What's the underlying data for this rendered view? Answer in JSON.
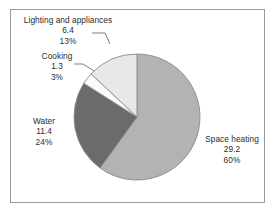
{
  "chart_data": {
    "type": "pie",
    "title": "",
    "subtitle": "",
    "xlabel": "",
    "ylabel": "",
    "legend_position": "none",
    "grid": false,
    "total": 48.3,
    "categories": [
      "Space heating",
      "Water",
      "Cooking",
      "Lighting and appliances"
    ],
    "values": [
      29.2,
      11.4,
      1.3,
      6.4
    ],
    "percentages": [
      "60%",
      "24%",
      "3%",
      "13%"
    ],
    "slices": [
      {
        "name": "Space heating",
        "value": "29.2",
        "percent": "60%",
        "percent_number": 60,
        "color": "#b3b3b3",
        "label_position": "right"
      },
      {
        "name": "Water",
        "value": "11.4",
        "percent": "24%",
        "percent_number": 24,
        "color": "#6b6b6b",
        "label_position": "left"
      },
      {
        "name": "Cooking",
        "value": "1.3",
        "percent": "3%",
        "percent_number": 3,
        "color": "#fbfbfb",
        "label_position": "upper-left"
      },
      {
        "name": "Lighting and appliances",
        "value": "6.4",
        "percent": "13%",
        "percent_number": 13,
        "color": "#e8e8e8",
        "label_position": "top-left"
      }
    ]
  },
  "colors": {
    "space_heating": "#b3b3b3",
    "water": "#6b6b6b",
    "cooking": "#fbfbfb",
    "lighting": "#e8e8e8",
    "slice_outline": "#8a8a8a",
    "frame_border": "#9a9a9a",
    "text": "#2b2b2b",
    "background": "#ffffff"
  }
}
